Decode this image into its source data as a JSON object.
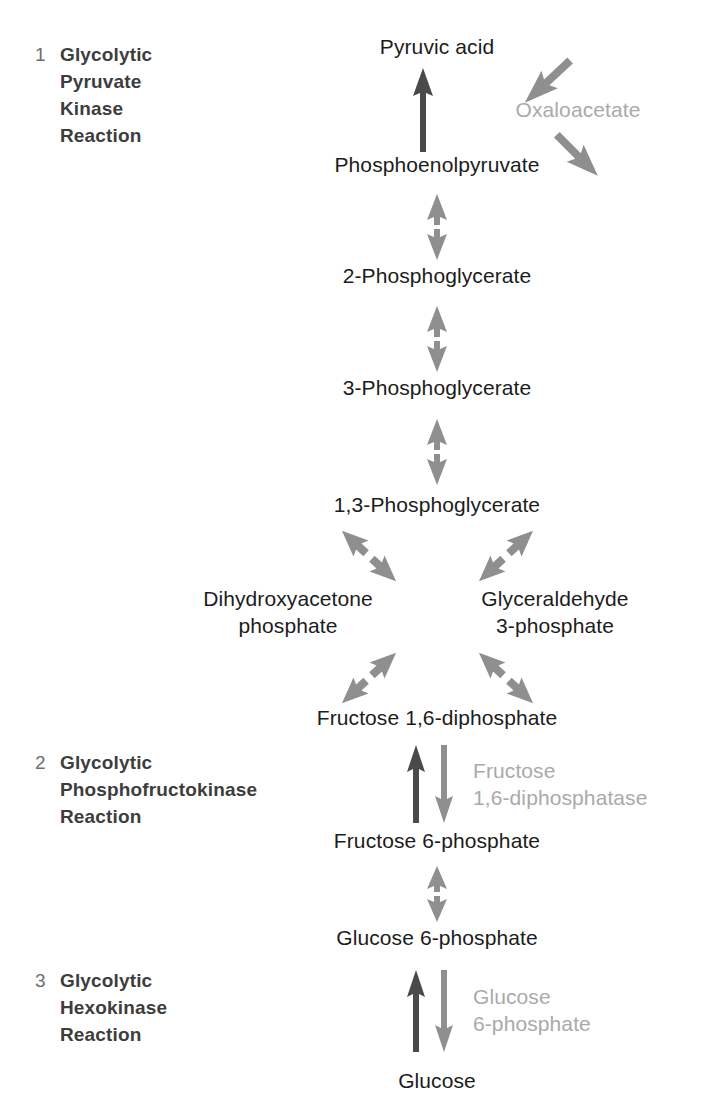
{
  "diagram": {
    "title_text_color": "#1c1c1c",
    "accent_colors": {
      "dark_arrow": "#4a4a4a",
      "gray_arrow": "#8e8f8f",
      "ghost_text": "#a9aaaa",
      "section_title": "#3d3d3d",
      "section_number": "#6d6e6e"
    }
  },
  "sections": [
    {
      "number": "1",
      "title": "Glycolytic\nPyruvate\nKinase\nReaction"
    },
    {
      "number": "2",
      "title": "Glycolytic\nPhosphofructokinase\nReaction"
    },
    {
      "number": "3",
      "title": "Glycolytic\nHexokinase\nReaction"
    }
  ],
  "metabolites": [
    {
      "id": "pyruvic-acid",
      "label": "Pyruvic acid"
    },
    {
      "id": "phosphoenolpyruvate",
      "label": "Phosphoenolpyruvate"
    },
    {
      "id": "2-phosphoglycerate",
      "label": "2-Phosphoglycerate"
    },
    {
      "id": "3-phosphoglycerate",
      "label": "3-Phosphoglycerate"
    },
    {
      "id": "1-3-phosphoglycerate",
      "label": "1,3-Phosphoglycerate"
    },
    {
      "id": "dihydroxyacetone-phosphate",
      "label": "Dihydroxyacetone\nphosphate"
    },
    {
      "id": "glyceraldehyde-3-phosphate",
      "label": "Glyceraldehyde\n3-phosphate"
    },
    {
      "id": "fructose-1-6-diphosphate",
      "label": "Fructose 1,6-diphosphate"
    },
    {
      "id": "fructose-6-phosphate",
      "label": "Fructose 6-phosphate"
    },
    {
      "id": "glucose-6-phosphate",
      "label": "Glucose 6-phosphate"
    },
    {
      "id": "glucose",
      "label": "Glucose"
    }
  ],
  "enzymes": [
    {
      "id": "oxaloacetate",
      "label": "Oxaloacetate"
    },
    {
      "id": "fructose-1-6-diphosphatase",
      "label": "Fructose\n1,6-diphosphatase"
    },
    {
      "id": "glucose-6-phosphatase",
      "label": "Glucose\n6-phosphate"
    }
  ]
}
